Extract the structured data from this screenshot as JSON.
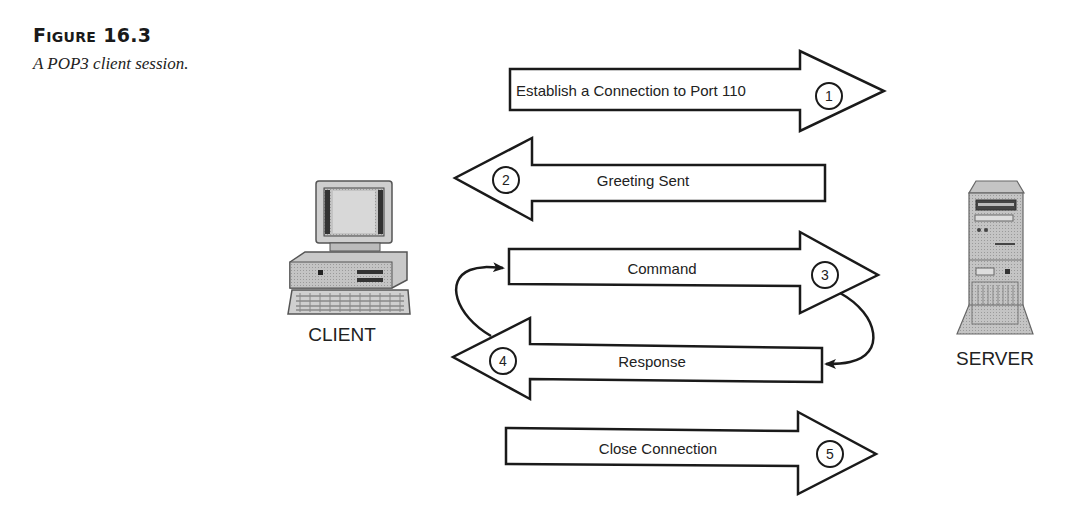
{
  "figure": {
    "title_prefix": "F",
    "title_smallcaps": "IGURE",
    "title_number": "16.3",
    "caption": "A POP3 client session."
  },
  "nodes": {
    "client": {
      "label": "CLIENT",
      "icon": "desktop-computer-icon"
    },
    "server": {
      "label": "SERVER",
      "icon": "tower-server-icon"
    }
  },
  "steps": [
    {
      "number": "1",
      "label": "Establish a Connection to Port 110",
      "direction": "client-to-server"
    },
    {
      "number": "2",
      "label": "Greeting Sent",
      "direction": "server-to-client"
    },
    {
      "number": "3",
      "label": "Command",
      "direction": "client-to-server"
    },
    {
      "number": "4",
      "label": "Response",
      "direction": "server-to-client"
    },
    {
      "number": "5",
      "label": "Close Connection",
      "direction": "client-to-server"
    }
  ],
  "loop": {
    "description": "Command/Response repeats",
    "from": [
      "3",
      "4"
    ]
  },
  "colors": {
    "stroke": "#1a1a1a",
    "fill": "#ffffff",
    "device_gray": "#b8b8b8"
  }
}
